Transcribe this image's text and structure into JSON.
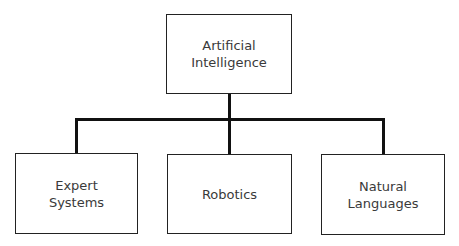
{
  "diagram": {
    "root": {
      "label_line1": "Artificial",
      "label_line2": "Intelligence"
    },
    "children": [
      {
        "label_line1": "Expert",
        "label_line2": "Systems"
      },
      {
        "label_line1": "Robotics",
        "label_line2": ""
      },
      {
        "label_line1": "Natural",
        "label_line2": "Languages"
      }
    ]
  }
}
